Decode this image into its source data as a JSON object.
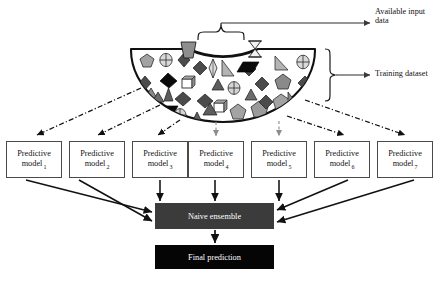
{
  "diagram": {
    "background": "#ffffff"
  },
  "annotations": [
    {
      "id": "available-input",
      "text": "Available input\ndata",
      "x": 375,
      "y": 7
    },
    {
      "id": "training-dataset",
      "text": "Training dataset",
      "x": 375,
      "y": 69
    }
  ],
  "labels": {
    "available_input": "Available input\ndata",
    "training_dataset": "Training dataset"
  },
  "models": {
    "line1": "Predictive",
    "line2": "model",
    "items": [
      {
        "index": "1",
        "line1": "Predictive",
        "line2": "model",
        "x": 6,
        "y": 141,
        "w": 56,
        "h": 37
      },
      {
        "index": "2",
        "line1": "Predictive",
        "line2": "model",
        "x": 69,
        "y": 141,
        "w": 56,
        "h": 37
      },
      {
        "index": "3",
        "line1": "Predictive",
        "line2": "model",
        "x": 132,
        "y": 141,
        "w": 56,
        "h": 37
      },
      {
        "index": "4",
        "line1": "Predictive",
        "line2": "model",
        "x": 188,
        "y": 141,
        "w": 56,
        "h": 37
      },
      {
        "index": "5",
        "line1": "Predictive",
        "line2": "model",
        "x": 251,
        "y": 141,
        "w": 56,
        "h": 37
      },
      {
        "index": "6",
        "line1": "Predictive",
        "line2": "model",
        "x": 314,
        "y": 141,
        "w": 56,
        "h": 37
      },
      {
        "index": "7",
        "line1": "Predictive",
        "line2": "model",
        "x": 377,
        "y": 141,
        "w": 56,
        "h": 37
      }
    ]
  },
  "ensemble": {
    "naive_label": "Naive ensemble",
    "naive_fill": "#3b3b3b",
    "final_label": "Final prediction",
    "final_fill": "#050505",
    "text_color": "#ffffff"
  },
  "colors": {
    "outline": "#111111",
    "box_border": "#4a4a4a",
    "arrow_solid": "#111111",
    "arrow_dashdot": "#111111",
    "arrow_dashed_light": "#9a9a9a",
    "shape_gray_light": "#b9b9b9",
    "shape_gray_mid": "#8e8e8e",
    "shape_gray_dark": "#5a5a5a",
    "shape_black": "#0a0a0a",
    "shape_white": "#ffffff"
  },
  "dataset": {
    "outer_label": "training dataset semicircle",
    "inner_label": "available input data semicircle",
    "shape_kinds": [
      "pentagon",
      "circle-cross",
      "diamond",
      "triangle",
      "square",
      "parallelogram",
      "ellipse",
      "trapezoid",
      "hourglass"
    ],
    "outer_shape_count": 38,
    "inner_shape_count": 6
  },
  "flows": {
    "dataset_to_models": "dash-dot arrows from training dataset to each predictive model",
    "models_to_ensemble": "solid arrows from each predictive model to naive ensemble",
    "ensemble_to_final": "solid arrow from naive ensemble to final prediction"
  }
}
